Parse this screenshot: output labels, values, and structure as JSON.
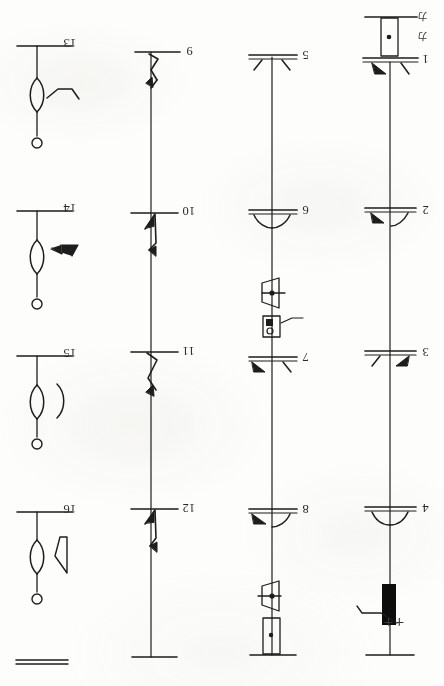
{
  "document": {
    "kind": "scanned-line-drawing-plate",
    "orientation_note": "180-degree-rotated",
    "background_color": "#fdfdfb",
    "ink_color": "#1d1d1d"
  },
  "plate": {
    "columns": [
      {
        "name": "column-1",
        "items": [
          {
            "id": "item-13",
            "label": "13",
            "label_x": 63,
            "label_y": 42,
            "stem_x": 37,
            "rule_y": 46,
            "rule_x1": 17,
            "rule_x2": 72,
            "body": "lens-with-zigzag",
            "terminal": "small-circle"
          },
          {
            "id": "item-14",
            "label": "14",
            "label_x": 63,
            "label_y": 207,
            "stem_x": 37,
            "rule_y": 211,
            "rule_x1": 17,
            "rule_x2": 72,
            "body": "lens-with-solid-arrow",
            "terminal": "small-circle"
          },
          {
            "id": "item-15",
            "label": "15",
            "label_x": 63,
            "label_y": 352,
            "stem_x": 37,
            "rule_y": 356,
            "rule_x1": 17,
            "rule_x2": 72,
            "body": "lens-with-arc",
            "terminal": "small-circle"
          },
          {
            "id": "item-16",
            "label": "16",
            "label_x": 63,
            "label_y": 508,
            "stem_x": 37,
            "rule_y": 512,
            "rule_x1": 17,
            "rule_x2": 72,
            "body": "lens-with-angle-bracket",
            "terminal": "small-circle"
          }
        ],
        "footer_rule": "double-line"
      },
      {
        "name": "column-2",
        "items": [
          {
            "id": "item-9",
            "label": "9",
            "label_x": 186,
            "label_y": 50,
            "stem_x": 151,
            "rule_y": 52,
            "rule_x1": 135,
            "rule_x2": 180,
            "body": "hook-barb-upper"
          },
          {
            "id": "item-10",
            "label": "10",
            "label_x": 182,
            "label_y": 210,
            "stem_x": 151,
            "rule_y": 213,
            "rule_x1": 131,
            "rule_x2": 178,
            "body": "zigzag-barb"
          },
          {
            "id": "item-11",
            "label": "11",
            "label_x": 182,
            "label_y": 353,
            "stem_x": 151,
            "rule_y": 352,
            "rule_x1": 131,
            "rule_x2": 178,
            "body": "hook-barb-long"
          },
          {
            "id": "item-12",
            "label": "12",
            "label_x": 182,
            "label_y": 510,
            "stem_x": 151,
            "rule_y": 509,
            "rule_x1": 131,
            "rule_x2": 178,
            "body": "zigzag-barb"
          }
        ],
        "footer_rule": "single-line"
      },
      {
        "name": "column-3",
        "items": [
          {
            "id": "item-5",
            "label": "5",
            "label_x": 300,
            "label_y": 54,
            "stem_x": 272,
            "rule_y": 57,
            "rule_x1": 249,
            "rule_x2": 296,
            "body": "double-rule-with-splayed-wings"
          },
          {
            "id": "item-6",
            "label": "6",
            "label_x": 300,
            "label_y": 210,
            "stem_x": 272,
            "rule_y": 212,
            "rule_x1": 249,
            "rule_x2": 296,
            "body": "double-rule-with-cupped-wings",
            "attachments": [
              "parallelogram-with-dot",
              "boxed-square-and-circle-with-leader"
            ]
          },
          {
            "id": "item-7",
            "label": "7",
            "label_x": 300,
            "label_y": 356,
            "stem_x": 272,
            "rule_y": 359,
            "rule_x1": 249,
            "rule_x2": 296,
            "body": "double-rule-with-splayed-wings-left-solid"
          },
          {
            "id": "item-8",
            "label": "8",
            "label_x": 300,
            "label_y": 508,
            "stem_x": 272,
            "rule_y": 511,
            "rule_x1": 249,
            "rule_x2": 296,
            "body": "double-rule-with-cupped-wings-left-solid",
            "attachments": [
              "parallelogram-with-dot",
              "rectangle-with-dot"
            ]
          }
        ],
        "footer_rule": "single-line"
      },
      {
        "name": "column-4",
        "items": [
          {
            "id": "item-1",
            "label": "1",
            "label_x": 418,
            "label_y": 58,
            "stem_x": 390,
            "rule_y": 62,
            "rule_x1": 365,
            "rule_x2": 414,
            "body": "double-rule-with-wings-left-solid",
            "attachments": [
              "tall-rectangle-with-dot"
            ]
          },
          {
            "id": "item-2",
            "label": "2",
            "label_x": 418,
            "label_y": 210,
            "stem_x": 390,
            "rule_y": 212,
            "rule_x1": 365,
            "rule_x2": 414,
            "body": "double-rule-with-cupped-wings-left-solid"
          },
          {
            "id": "item-3",
            "label": "3",
            "label_x": 418,
            "label_y": 352,
            "stem_x": 390,
            "rule_y": 355,
            "rule_x1": 365,
            "rule_x2": 414,
            "body": "double-rule-with-wings-right-solid"
          },
          {
            "id": "item-4",
            "label": "4",
            "label_x": 418,
            "label_y": 508,
            "stem_x": 390,
            "rule_y": 511,
            "rule_x1": 365,
            "rule_x2": 414,
            "body": "double-rule-with-cupped-wings",
            "attachments": [
              "solid-black-bar",
              "leader-with-plus-plus"
            ]
          }
        ],
        "footer_rule": "single-line"
      }
    ],
    "annotations": [
      {
        "id": "katakana-mark-upper",
        "text": "カ",
        "x": 418,
        "y": 14
      },
      {
        "id": "katakana-mark-lower",
        "text": "カ",
        "x": 418,
        "y": 34
      },
      {
        "id": "plus-plus-mark",
        "text": "++",
        "x": 388,
        "y": 622
      }
    ]
  }
}
